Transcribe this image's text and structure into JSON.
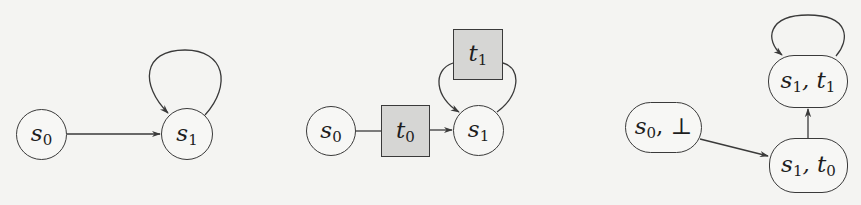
{
  "diagrams": [
    {
      "name": "kripke-structure",
      "nodes": [
        {
          "id": "s0",
          "base": "s",
          "sub": "0",
          "shape": "circle"
        },
        {
          "id": "s1",
          "base": "s",
          "sub": "1",
          "shape": "circle"
        }
      ],
      "edges": [
        {
          "from": "s0",
          "to": "s1"
        },
        {
          "from": "s1",
          "to": "s1",
          "kind": "self-loop"
        }
      ]
    },
    {
      "name": "petri-style-unfolding",
      "nodes": [
        {
          "id": "s0",
          "base": "s",
          "sub": "0",
          "shape": "circle"
        },
        {
          "id": "t0",
          "base": "t",
          "sub": "0",
          "shape": "square"
        },
        {
          "id": "s1",
          "base": "s",
          "sub": "1",
          "shape": "circle"
        },
        {
          "id": "t1",
          "base": "t",
          "sub": "1",
          "shape": "square"
        }
      ],
      "edges": [
        {
          "from": "s0",
          "to": "t0"
        },
        {
          "from": "t0",
          "to": "s1"
        },
        {
          "from": "s1",
          "to": "t1"
        },
        {
          "from": "t1",
          "to": "s1"
        }
      ]
    },
    {
      "name": "product-structure",
      "nodes": [
        {
          "id": "s0_bot",
          "base": "s",
          "sub": "0",
          "suffix": ", ⊥",
          "shape": "pill"
        },
        {
          "id": "s1_t0",
          "base": "s",
          "sub": "1",
          "suffix": ", t",
          "sub2": "0",
          "shape": "pill"
        },
        {
          "id": "s1_t1",
          "base": "s",
          "sub": "1",
          "suffix": ", t",
          "sub2": "1",
          "shape": "pill"
        }
      ],
      "edges": [
        {
          "from": "s0_bot",
          "to": "s1_t0"
        },
        {
          "from": "s1_t0",
          "to": "s1_t1"
        },
        {
          "from": "s1_t1",
          "to": "s1_t1",
          "kind": "self-loop"
        }
      ]
    }
  ],
  "colors": {
    "background": "#f4f4f2",
    "stroke": "#3a3a3a",
    "transition_fill": "#d6d6d4"
  }
}
